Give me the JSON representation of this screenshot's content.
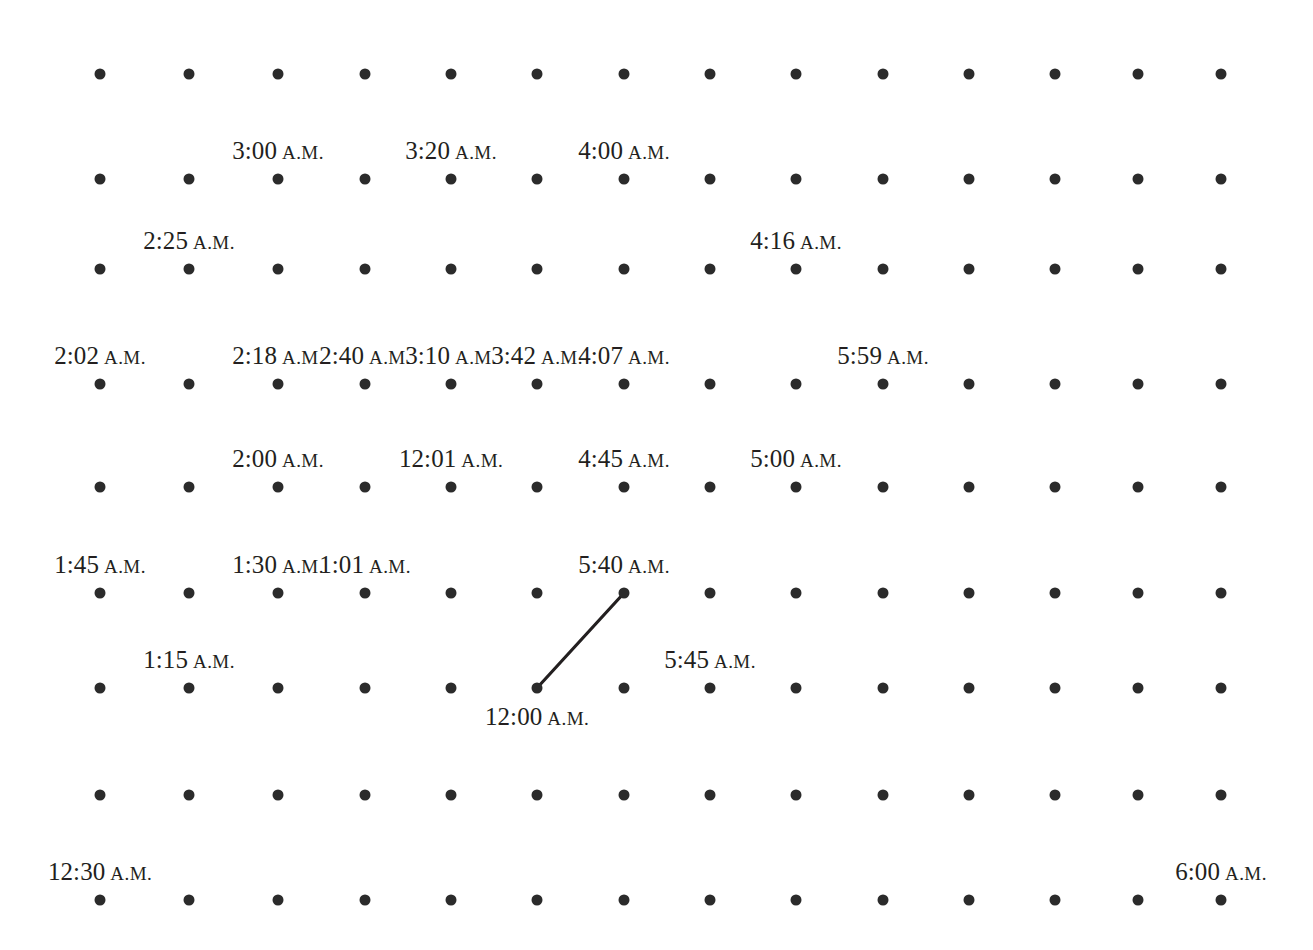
{
  "figure": {
    "width": 1313,
    "height": 950,
    "background": "#ffffff",
    "dot_color": "#2b2b2b",
    "text_color": "#231f20",
    "line_color": "#231f20",
    "grid": {
      "columns": 14,
      "rows": 9,
      "col_x": [
        100,
        189,
        278,
        365,
        451,
        537,
        624,
        710,
        796,
        883,
        969,
        1055,
        1138,
        1221
      ],
      "row_y": [
        74,
        179,
        269,
        384,
        487,
        593,
        688,
        795,
        900
      ]
    }
  },
  "chart_data": {
    "type": "scatter",
    "title": "",
    "xlabel": "",
    "ylabel": "",
    "grid": true,
    "legend": null,
    "points": [
      {
        "row": 1,
        "col": 1
      },
      {
        "row": 1,
        "col": 2
      },
      {
        "row": 1,
        "col": 3
      },
      {
        "row": 1,
        "col": 4
      },
      {
        "row": 1,
        "col": 5
      },
      {
        "row": 1,
        "col": 6
      },
      {
        "row": 1,
        "col": 7
      },
      {
        "row": 1,
        "col": 8
      },
      {
        "row": 1,
        "col": 9
      },
      {
        "row": 1,
        "col": 10
      },
      {
        "row": 1,
        "col": 11
      },
      {
        "row": 1,
        "col": 12
      },
      {
        "row": 1,
        "col": 13
      },
      {
        "row": 1,
        "col": 14
      }
    ],
    "annotations": [
      {
        "text": "3:00",
        "suffix": "A.M.",
        "row": 2,
        "col": 3,
        "placement": "above"
      },
      {
        "text": "3:20",
        "suffix": "A.M.",
        "row": 2,
        "col": 5,
        "placement": "above"
      },
      {
        "text": "4:00",
        "suffix": "A.M.",
        "row": 2,
        "col": 7,
        "placement": "above"
      },
      {
        "text": "2:25",
        "suffix": "A.M.",
        "row": 3,
        "col": 2,
        "placement": "above"
      },
      {
        "text": "4:16",
        "suffix": "A.M.",
        "row": 3,
        "col": 9,
        "placement": "above"
      },
      {
        "text": "2:02",
        "suffix": "A.M.",
        "row": 4,
        "col": 1,
        "placement": "above"
      },
      {
        "text": "2:18",
        "suffix": "A.M.",
        "row": 4,
        "col": 3,
        "placement": "above"
      },
      {
        "text": "2:40",
        "suffix": "A.M.",
        "row": 4,
        "col": 4,
        "placement": "above"
      },
      {
        "text": "3:10",
        "suffix": "A.M.",
        "row": 4,
        "col": 5,
        "placement": "above"
      },
      {
        "text": "3:42",
        "suffix": "A.M.",
        "row": 4,
        "col": 6,
        "placement": "above"
      },
      {
        "text": "4:07",
        "suffix": "A.M.",
        "row": 4,
        "col": 7,
        "placement": "above"
      },
      {
        "text": "5:59",
        "suffix": "A.M.",
        "row": 4,
        "col": 10,
        "placement": "above"
      },
      {
        "text": "2:00",
        "suffix": "A.M.",
        "row": 5,
        "col": 3,
        "placement": "above"
      },
      {
        "text": "12:01",
        "suffix": "A.M.",
        "row": 5,
        "col": 5,
        "placement": "above"
      },
      {
        "text": "4:45",
        "suffix": "A.M.",
        "row": 5,
        "col": 7,
        "placement": "above"
      },
      {
        "text": "5:00",
        "suffix": "A.M.",
        "row": 5,
        "col": 9,
        "placement": "above"
      },
      {
        "text": "1:45",
        "suffix": "A.M.",
        "row": 6,
        "col": 1,
        "placement": "above"
      },
      {
        "text": "1:30",
        "suffix": "A.M.",
        "row": 6,
        "col": 3,
        "placement": "above"
      },
      {
        "text": "1:01",
        "suffix": "A.M.",
        "row": 6,
        "col": 4,
        "placement": "above"
      },
      {
        "text": "5:40",
        "suffix": "A.M.",
        "row": 6,
        "col": 7,
        "placement": "above"
      },
      {
        "text": "1:15",
        "suffix": "A.M.",
        "row": 7,
        "col": 2,
        "placement": "above"
      },
      {
        "text": "12:00",
        "suffix": "A.M.",
        "row": 7,
        "col": 6,
        "placement": "below"
      },
      {
        "text": "5:45",
        "suffix": "A.M.",
        "row": 7,
        "col": 8,
        "placement": "above"
      },
      {
        "text": "12:30",
        "suffix": "A.M.",
        "row": 9,
        "col": 1,
        "placement": "above"
      },
      {
        "text": "6:00",
        "suffix": "A.M.",
        "row": 9,
        "col": 14,
        "placement": "above"
      }
    ],
    "segments": [
      {
        "from": {
          "row": 7,
          "col": 6
        },
        "to": {
          "row": 6,
          "col": 7
        },
        "from_label": "12:00 A.M.",
        "to_label": "5:40 A.M."
      }
    ]
  }
}
